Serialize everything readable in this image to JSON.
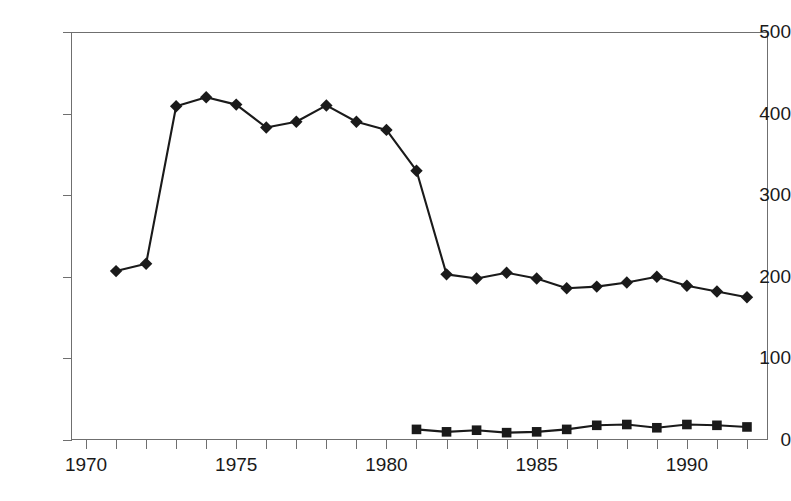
{
  "chart_data": {
    "type": "line",
    "title": "",
    "subtitle": "",
    "xlabel": "",
    "ylabel": "",
    "xlim": [
      1969.5,
      1992.7
    ],
    "ylim": [
      0,
      500
    ],
    "grid": false,
    "legend": "none",
    "y_ticks": [
      0,
      100,
      200,
      300,
      400,
      500
    ],
    "y_tick_labels": [
      "0",
      "100",
      "200",
      "300",
      "400",
      "500"
    ],
    "x_ticks": [
      1970,
      1971,
      1972,
      1973,
      1974,
      1975,
      1976,
      1977,
      1978,
      1979,
      1980,
      1981,
      1982,
      1983,
      1984,
      1985,
      1986,
      1987,
      1988,
      1989,
      1990,
      1991,
      1992
    ],
    "x_tick_labels": [
      "1970",
      "",
      "",
      "",
      "",
      "1975",
      "",
      "",
      "",
      "",
      "1980",
      "",
      "",
      "",
      "",
      "1985",
      "",
      "",
      "",
      "",
      "1990",
      "",
      ""
    ],
    "x_labeled_ticks": [
      {
        "value": 1970,
        "label": "1970"
      },
      {
        "value": 1975,
        "label": "1975"
      },
      {
        "value": 1980,
        "label": "1980"
      },
      {
        "value": 1985,
        "label": "1985"
      },
      {
        "value": 1990,
        "label": "1990"
      }
    ],
    "series": [
      {
        "name": "series-diamond",
        "marker": "diamond",
        "color": "#1a1a1a",
        "x": [
          1971,
          1972,
          1973,
          1974,
          1975,
          1976,
          1977,
          1978,
          1979,
          1980,
          1981,
          1982,
          1983,
          1984,
          1985,
          1986,
          1987,
          1988,
          1989,
          1990,
          1991,
          1992
        ],
        "values": [
          207,
          216,
          409,
          420,
          411,
          383,
          390,
          410,
          390,
          380,
          330,
          203,
          198,
          205,
          198,
          186,
          188,
          193,
          200,
          189,
          182,
          175
        ]
      },
      {
        "name": "series-square",
        "marker": "square",
        "color": "#1a1a1a",
        "x": [
          1981,
          1982,
          1983,
          1984,
          1985,
          1986,
          1987,
          1988,
          1989,
          1990,
          1991,
          1992
        ],
        "values": [
          13,
          10,
          12,
          9,
          10,
          13,
          18,
          19,
          15,
          19,
          18,
          16
        ]
      }
    ]
  }
}
